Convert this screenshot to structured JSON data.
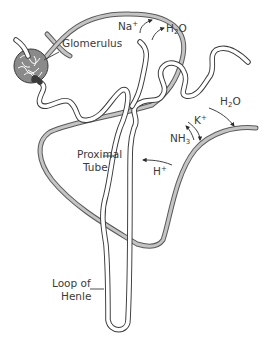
{
  "diagram": {
    "structures": [
      {
        "id": "glomerulus",
        "label": "Glomerulus"
      },
      {
        "id": "proximal_tube",
        "label_line1": "Proximal",
        "label_line2": "Tube"
      },
      {
        "id": "loop_of_henle",
        "label_line1": "Loop of",
        "label_line2": "Henle"
      }
    ],
    "ions": {
      "na": {
        "base": "Na",
        "sup": "+",
        "direction": "out of tubule"
      },
      "h2o_top": {
        "base": "H",
        "sub": "2",
        "tail": "O",
        "direction": "out of tubule"
      },
      "h2o_right": {
        "base": "H",
        "sub": "2",
        "tail": "O",
        "direction": "out of tubule"
      },
      "k": {
        "base": "K",
        "sup": "+",
        "direction": "out of tubule"
      },
      "nh3": {
        "base": "NH",
        "sub": "3",
        "direction": "into tubule"
      },
      "h": {
        "base": "H",
        "sup": "+",
        "direction": "into tubule"
      }
    },
    "colors": {
      "outline": "#3a3a3a",
      "vessel_fill": "#c4c4c4",
      "glomerulus_fill": "#8a8a8a",
      "background": "#ffffff"
    }
  }
}
